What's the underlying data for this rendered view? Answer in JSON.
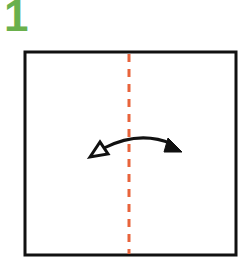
{
  "step": {
    "number": "1"
  },
  "colors": {
    "step_number": "#6ab04c",
    "paper_outline": "#111111",
    "fold_line": "#e8643c",
    "arrow": "#111111"
  },
  "diagram": {
    "paper": "square sheet",
    "fold_line": "vertical valley fold (dashed) through center",
    "arrow": "fold and unfold arrow, left to right"
  }
}
